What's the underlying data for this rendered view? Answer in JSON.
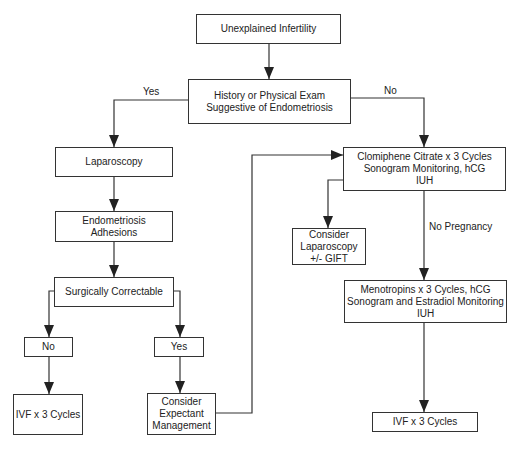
{
  "diagram": {
    "nodes": {
      "start": "Unexplained Infertility",
      "history": "History or Physical Exam\nSuggestive of Endometriosis",
      "laparoscopy": "Laparoscopy",
      "endometriosis": "Endometriosis\nAdhesions",
      "surgically": "Surgically Correctable",
      "no_box": "No",
      "yes_box": "Yes",
      "ivf_left": "IVF x 3 Cycles",
      "expectant": "Consider\nExpectant\nManagement",
      "clomiphene": "Clomiphene Citrate x 3 Cycles\nSonogram Monitoring, hCG\nIUH",
      "consider_lap": "Consider\nLaparoscopy\n+/- GIFT",
      "menotropins": "Menotropins x 3 Cycles, hCG\nSonogram and Estradiol Monitoring\nIUH",
      "ivf_right": "IVF x 3 Cycles"
    },
    "edge_labels": {
      "yes": "Yes",
      "no": "No",
      "no_pregnancy": "No  Pregnancy"
    },
    "colors": {
      "line": "#333333",
      "background": "#ffffff"
    }
  }
}
